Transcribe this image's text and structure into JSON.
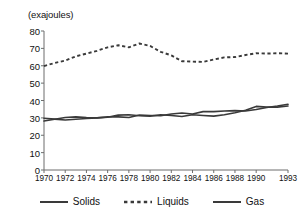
{
  "chart_data": {
    "type": "line",
    "title": "(exajoules)",
    "xlabel": "",
    "ylabel": "(exajoules)",
    "ylim": [
      0,
      80
    ],
    "ytick_values": [
      0,
      10,
      20,
      30,
      40,
      50,
      60,
      70,
      80
    ],
    "xlim": [
      1970,
      1993
    ],
    "xtick_labels": [
      "1970",
      "1972",
      "1974",
      "1976",
      "1978",
      "1980",
      "1982",
      "1984",
      "1986",
      "1988",
      "1990",
      "1993"
    ],
    "xtick_values": [
      1970,
      1972,
      1974,
      1976,
      1978,
      1980,
      1982,
      1984,
      1986,
      1988,
      1990,
      1993
    ],
    "grid": false,
    "legend_position": "bottom",
    "x": [
      1970,
      1971,
      1972,
      1973,
      1974,
      1975,
      1976,
      1977,
      1978,
      1979,
      1980,
      1981,
      1982,
      1983,
      1984,
      1985,
      1986,
      1987,
      1988,
      1989,
      1990,
      1991,
      1992,
      1993
    ],
    "series": [
      {
        "name": "Solids",
        "style": "solid",
        "color": "#3a3a3a",
        "values": [
          29.8,
          29.3,
          28.8,
          29.2,
          29.6,
          30.0,
          30.6,
          30.6,
          30.2,
          31.6,
          31.4,
          31.2,
          32.2,
          32.8,
          32.2,
          33.6,
          33.6,
          34.0,
          34.2,
          34.0,
          34.8,
          36.0,
          36.8,
          37.8
        ]
      },
      {
        "name": "Liquids",
        "style": "dashed",
        "color": "#3a3a3a",
        "values": [
          59.8,
          61.6,
          63.0,
          65.4,
          67.0,
          68.6,
          70.6,
          71.8,
          70.6,
          72.8,
          71.4,
          68.0,
          66.0,
          62.6,
          62.4,
          62.2,
          63.6,
          64.8,
          65.0,
          66.2,
          67.2,
          67.0,
          67.2,
          67.0
        ]
      },
      {
        "name": "Gas",
        "style": "solid",
        "color": "#3a3a3a",
        "values": [
          28.2,
          29.2,
          30.2,
          30.6,
          30.2,
          30.0,
          30.4,
          31.6,
          31.8,
          31.2,
          31.0,
          31.8,
          31.4,
          30.8,
          31.8,
          31.4,
          31.0,
          31.8,
          33.0,
          34.4,
          36.6,
          36.2,
          36.2,
          36.8
        ]
      }
    ],
    "legend": [
      {
        "label": "Solids",
        "style": "solid"
      },
      {
        "label": "Liquids",
        "style": "dashed"
      },
      {
        "label": "Gas",
        "style": "solid"
      }
    ]
  }
}
